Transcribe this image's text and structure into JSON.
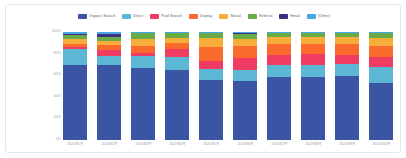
{
  "chart_data": {
    "type": "bar",
    "stacked": true,
    "normalized": "100%",
    "title": "",
    "xlabel": "",
    "ylabel": "",
    "ylim": [
      0,
      100
    ],
    "grid": false,
    "legend_position": "top-center",
    "y_ticks": [
      "100%",
      "80%",
      "60%",
      "40%",
      "20%",
      "0%"
    ],
    "y_tick_values": [
      100,
      80,
      60,
      40,
      20,
      0
    ],
    "categories": [
      "2020年1月",
      "2020年2月",
      "2020年3月",
      "2020年4月",
      "2020年5月",
      "2020年6月",
      "2020年7月",
      "2020年8月",
      "2020年9月",
      "2020年10月"
    ],
    "series": [
      {
        "name": "Organic Search",
        "color": "#3b55a5",
        "values": [
          69.5,
          69.0,
          66.5,
          65.0,
          55.5,
          54.5,
          58.5,
          58.5,
          59.0,
          53.0
        ]
      },
      {
        "name": "Direct",
        "color": "#5bb7d4",
        "values": [
          14.5,
          9.0,
          11.0,
          11.5,
          10.0,
          10.5,
          11.0,
          11.0,
          11.0,
          14.5
        ]
      },
      {
        "name": "Paid Search",
        "color": "#f03c62",
        "values": [
          2.0,
          5.5,
          3.0,
          7.5,
          8.0,
          11.0,
          9.5,
          10.0,
          8.5,
          9.0
        ]
      },
      {
        "name": "Display",
        "color": "#fa6a2d",
        "values": [
          3.0,
          4.0,
          6.5,
          5.5,
          13.0,
          11.0,
          9.5,
          9.0,
          10.0,
          10.5
        ]
      },
      {
        "name": "Social",
        "color": "#f6ad3c",
        "values": [
          4.5,
          4.0,
          6.5,
          5.0,
          7.5,
          6.5,
          6.5,
          6.5,
          6.5,
          7.5
        ]
      },
      {
        "name": "Referral",
        "color": "#69ab44",
        "values": [
          3.5,
          3.5,
          5.5,
          4.5,
          5.0,
          4.5,
          4.0,
          4.0,
          4.0,
          4.5
        ]
      },
      {
        "name": "Email",
        "color": "#3b2f82",
        "values": [
          1.0,
          3.5,
          0.5,
          0.5,
          0.5,
          1.5,
          0.5,
          0.5,
          0.5,
          0.5
        ]
      },
      {
        "name": "(Other)",
        "color": "#49a7e8",
        "values": [
          2.0,
          1.5,
          0.5,
          0.5,
          0.5,
          0.5,
          0.5,
          0.5,
          0.5,
          0.5
        ]
      }
    ]
  }
}
